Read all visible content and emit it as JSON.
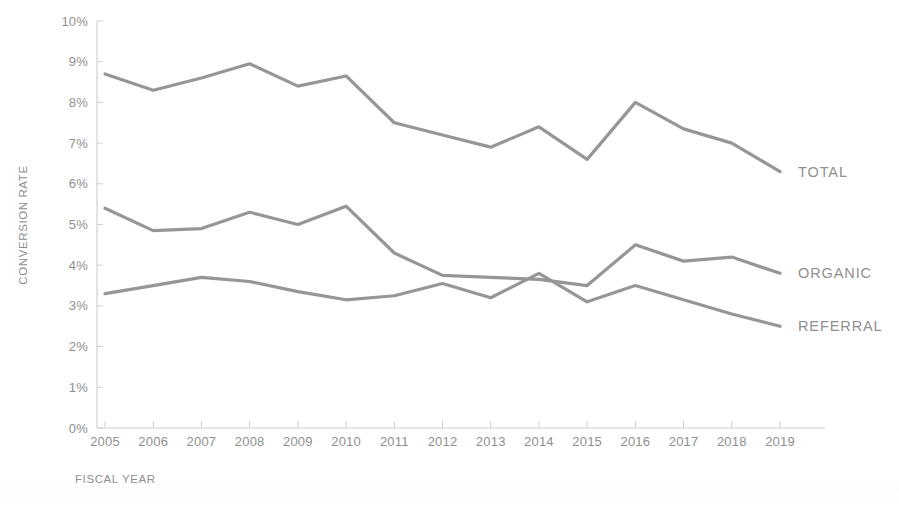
{
  "chart_data": {
    "type": "line",
    "title": "",
    "xlabel": "FISCAL YEAR",
    "ylabel": "CONVERSION RATE",
    "categories": [
      "2005",
      "2006",
      "2007",
      "2008",
      "2009",
      "2010",
      "2011",
      "2012",
      "2013",
      "2014",
      "2015",
      "2016",
      "2017",
      "2018",
      "2019"
    ],
    "x": [
      2005,
      2006,
      2007,
      2008,
      2009,
      2010,
      2011,
      2012,
      2013,
      2014,
      2015,
      2016,
      2017,
      2018,
      2019
    ],
    "ylim": [
      0,
      10
    ],
    "yticks": [
      0,
      1,
      2,
      3,
      4,
      5,
      6,
      7,
      8,
      9,
      10
    ],
    "ytick_labels": [
      "0%",
      "1%",
      "2%",
      "3%",
      "4%",
      "5%",
      "6%",
      "7%",
      "8%",
      "9%",
      "10%"
    ],
    "y_unit": "%",
    "grid": false,
    "legend_position": "right-inline",
    "series": [
      {
        "name": "TOTAL",
        "color": "#969696",
        "values": [
          8.7,
          8.3,
          8.6,
          8.95,
          8.4,
          8.65,
          7.5,
          7.2,
          6.9,
          7.4,
          6.6,
          8.0,
          7.35,
          7.0,
          6.3
        ]
      },
      {
        "name": "ORGANIC",
        "color": "#969696",
        "values": [
          5.4,
          4.85,
          4.9,
          5.3,
          5.0,
          5.45,
          4.3,
          3.75,
          3.7,
          3.65,
          3.5,
          4.5,
          4.1,
          4.2,
          3.8
        ]
      },
      {
        "name": "REFERRAL",
        "color": "#969696",
        "values": [
          3.3,
          3.5,
          3.7,
          3.6,
          3.35,
          3.15,
          3.25,
          3.55,
          3.2,
          3.8,
          3.1,
          3.5,
          3.15,
          2.8,
          2.5
        ]
      }
    ]
  },
  "axes": {
    "y_title": "CONVERSION RATE",
    "x_title": "FISCAL YEAR"
  },
  "colors": {
    "line": "#969696",
    "text": "#8f8f8f",
    "axis": "#d0d0d0",
    "background": "#ffffff"
  }
}
